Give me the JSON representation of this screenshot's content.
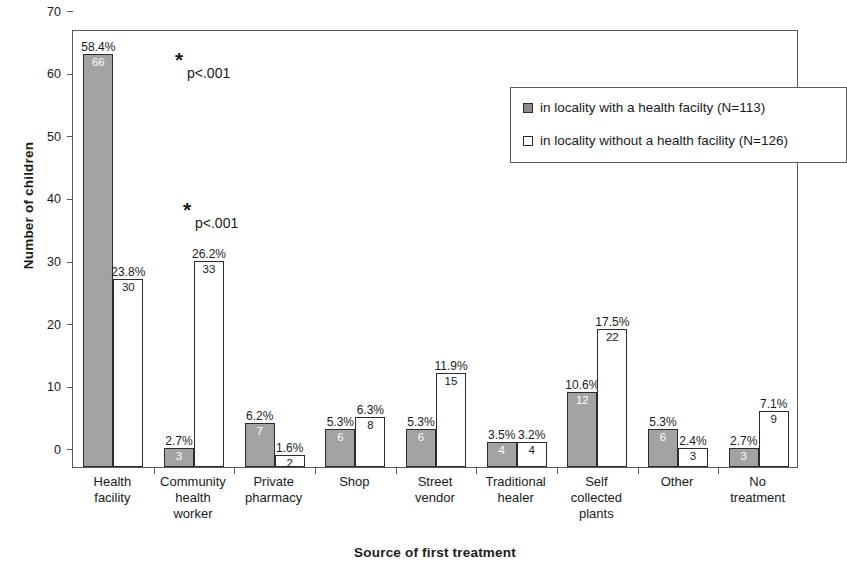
{
  "chart_data": {
    "type": "bar",
    "title": "",
    "xlabel": "Source of first treatment",
    "ylabel": "Number of children",
    "ylim": [
      0,
      70
    ],
    "yticks": [
      0,
      10,
      20,
      30,
      40,
      50,
      60,
      70
    ],
    "grid": false,
    "legend_position": "top-right",
    "categories": [
      "Health facility",
      "Community health worker",
      "Private pharmacy",
      "Shop",
      "Street vendor",
      "Traditional healer",
      "Self collected plants",
      "Other",
      "No treatment"
    ],
    "series": [
      {
        "name": "in locality with a health facilty (N=113)",
        "color": "#a3a3a3",
        "values": [
          66,
          3,
          7,
          6,
          6,
          4,
          12,
          6,
          3
        ],
        "percent_labels": [
          "58.4%",
          "2.7%",
          "6.2%",
          "5.3%",
          "5.3%",
          "3.5%",
          "10.6%",
          "5.3%",
          "2.7%"
        ]
      },
      {
        "name": "in locality without a health facility (N=126)",
        "color": "#ffffff",
        "values": [
          30,
          33,
          2,
          8,
          15,
          4,
          22,
          3,
          9
        ],
        "percent_labels": [
          "23.8%",
          "26.2%",
          "1.6%",
          "6.3%",
          "11.9%",
          "3.2%",
          "17.5%",
          "2.4%",
          "7.1%"
        ]
      }
    ],
    "annotations": [
      {
        "id": "sig-health-facility",
        "star": "*",
        "text": "p<.001",
        "category": "Health facility"
      },
      {
        "id": "sig-community-health-worker",
        "star": "*",
        "text": "p<.001",
        "category": "Community health worker"
      }
    ]
  },
  "x_labels": [
    [
      "Health",
      "facility"
    ],
    [
      "Community",
      "health",
      "worker"
    ],
    [
      "Private",
      "pharmacy"
    ],
    [
      "Shop"
    ],
    [
      "Street",
      "vendor"
    ],
    [
      "Traditional",
      "healer"
    ],
    [
      "Self",
      "collected",
      "plants"
    ],
    [
      "Other"
    ],
    [
      "No",
      "treatment"
    ]
  ],
  "colors": {
    "series_gray": "#a3a3a3",
    "series_white": "#ffffff",
    "axis": "#5b5b5b",
    "bar_outline": "#2b2b2b",
    "text": "#1a1a1a"
  }
}
